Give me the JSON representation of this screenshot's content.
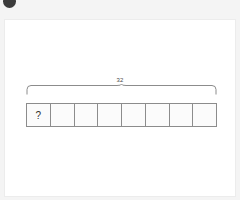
{
  "badge": {
    "icon": "circle-bullet-marker",
    "label": ""
  },
  "card": {
    "background_color": "#ffffff",
    "border_color": "#ececec"
  },
  "diagram": {
    "type": "tape-diagram",
    "total_label": "32",
    "bracket_style": "curly-brace-top",
    "cell_count": 8,
    "cells": [
      {
        "label": "?"
      },
      {
        "label": ""
      },
      {
        "label": ""
      },
      {
        "label": ""
      },
      {
        "label": ""
      },
      {
        "label": ""
      },
      {
        "label": ""
      },
      {
        "label": ""
      }
    ],
    "line_color": "#8c8c8c",
    "cell_fill": "#fbfbfb"
  },
  "page": {
    "background_color": "#f4f4f4"
  }
}
